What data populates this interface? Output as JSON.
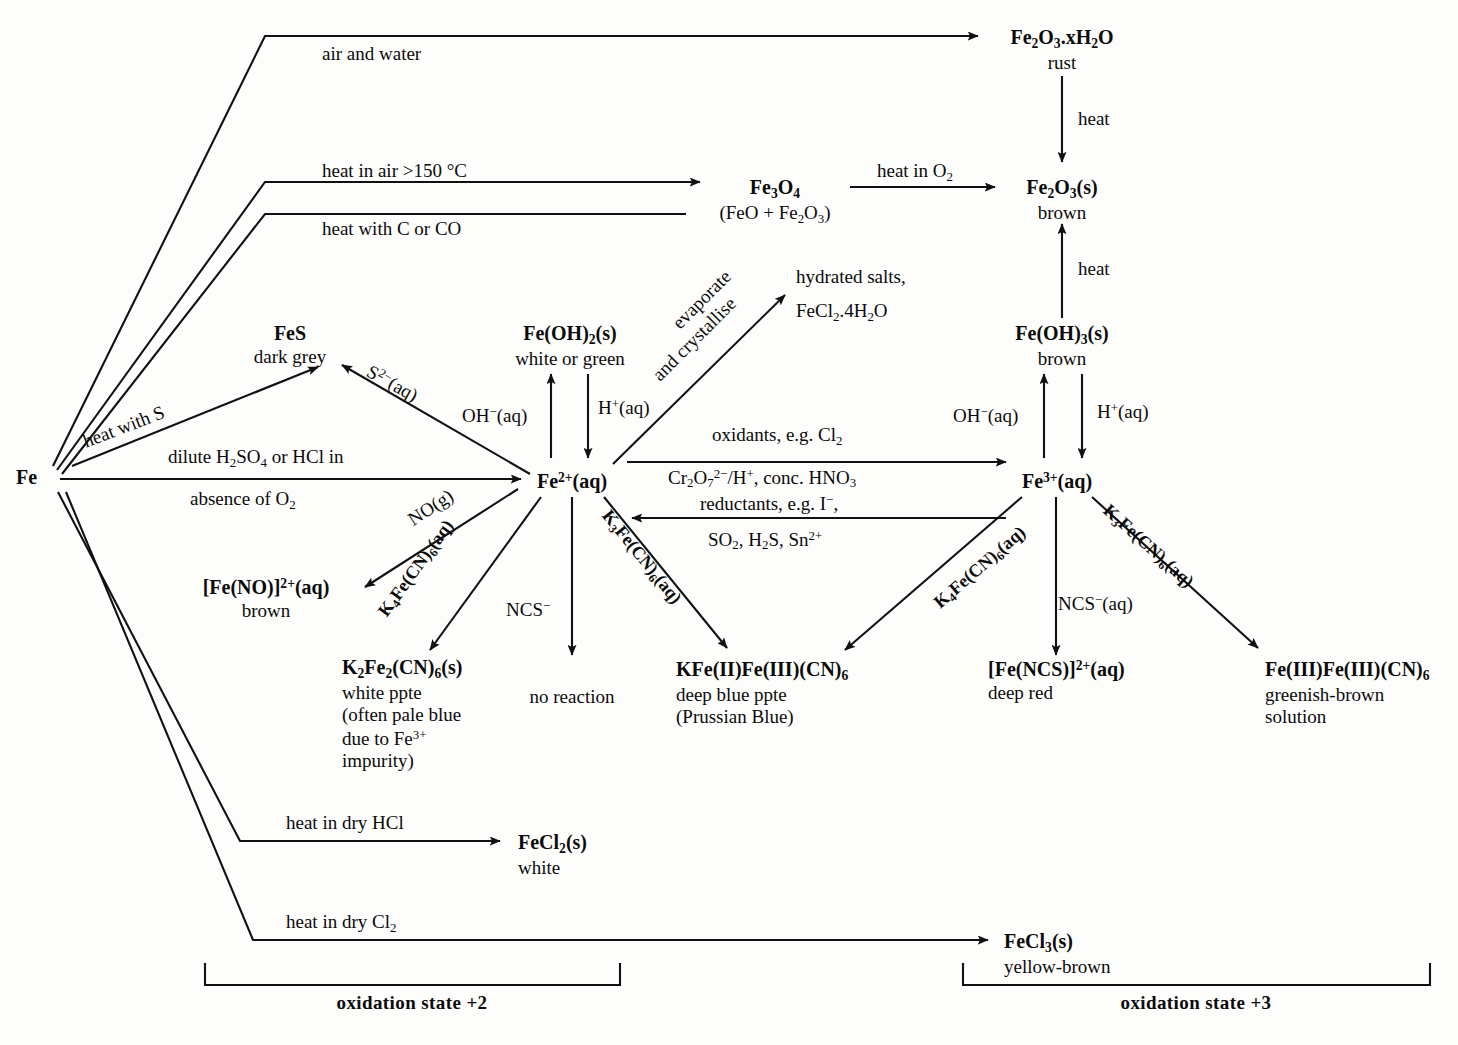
{
  "diagram": {
    "ink_color": "#111111",
    "background": "#fdfdfb"
  },
  "nodes": {
    "fe": {
      "name": "Fe",
      "sub": ""
    },
    "rust": {
      "name": "Fe2O3.xH2O",
      "sub": "rust"
    },
    "fe3o4": {
      "name": "Fe3O4",
      "sub": "(FeO + Fe2O3)"
    },
    "fe2o3": {
      "name": "Fe2O3(s)",
      "sub": "brown"
    },
    "fes": {
      "name": "FeS",
      "sub": "dark grey"
    },
    "feoh2": {
      "name": "Fe(OH)2(s)",
      "sub": "white or green"
    },
    "feoh3": {
      "name": "Fe(OH)3(s)",
      "sub": "brown"
    },
    "fe2plus": {
      "name": "Fe2+(aq)",
      "sub": ""
    },
    "fe3plus": {
      "name": "Fe3+(aq)",
      "sub": ""
    },
    "hydrated": {
      "name": "hydrated salts,",
      "sub": "FeCl2.4H2O"
    },
    "feno": {
      "name": "[Fe(NO)]2+(aq)",
      "sub": "brown"
    },
    "k2fe2cn6": {
      "name": "K2Fe2(CN)6(s)",
      "sub": "white ppte\n(often pale blue\ndue to Fe3+\nimpurity)"
    },
    "noreaction": {
      "name": "no reaction",
      "sub": ""
    },
    "prussian": {
      "name": "KFe(II)Fe(III)(CN)6",
      "sub": "deep blue ppte\n(Prussian Blue)"
    },
    "fencs": {
      "name": "[Fe(NCS)]2+(aq)",
      "sub": "deep red"
    },
    "feiiifeiii": {
      "name": "Fe(III)Fe(III)(CN)6",
      "sub": "greenish-brown\nsolution"
    },
    "fecl2": {
      "name": "FeCl2(s)",
      "sub": "white"
    },
    "fecl3": {
      "name": "FeCl3(s)",
      "sub": "yellow-brown"
    }
  },
  "edge_labels": {
    "air_and_water": "air and water",
    "heat_in_air": "heat in air >150 °C",
    "heat_with_c_or_co": "heat with C or CO",
    "heat_in_o2": "heat in O2",
    "heat_rust_to_fe2o3": "heat",
    "heat_feoh3_to_fe2o3": "heat",
    "heat_with_s": "heat with S",
    "dilute_acid_line1": "dilute H2SO4 or HCl in",
    "dilute_acid_line2": "absence of O2",
    "sulfide": "S2-(aq)",
    "oh_fe2": "OH-(aq)",
    "h_fe2": "H+(aq)",
    "oh_fe3": "OH-(aq)",
    "h_fe3": "H+(aq)",
    "evaporate_line1": "evaporate",
    "evaporate_line2": "and crystallise",
    "oxidants_line1": "oxidants, e.g. Cl2",
    "oxidants_line2": "Cr2O72-/H+, conc. HNO3",
    "reductants_line1": "reductants, e.g. I-,",
    "reductants_line2": "SO2, H2S, Sn2+",
    "no_gas": "NO(g)",
    "k4_from_fe2": "K4Fe(CN)6(aq)",
    "ncs_fe2": "NCS-",
    "k3_from_fe2": "K3Fe(CN)6(aq)",
    "k4_from_fe3": "K4Fe(CN)6(aq)",
    "ncs_fe3": "NCS-(aq)",
    "k3_from_fe3": "K3Fe(CN)6(aq)",
    "heat_dry_hcl": "heat in dry HCl",
    "heat_dry_cl2": "heat in dry Cl2"
  },
  "brackets": {
    "left_label": "oxidation state +2",
    "right_label": "oxidation state +3"
  }
}
